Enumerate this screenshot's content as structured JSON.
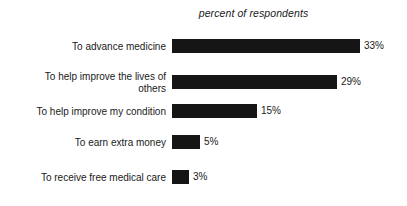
{
  "chart_data": {
    "type": "bar",
    "orientation": "horizontal",
    "title": "percent of respondents",
    "xlabel": "",
    "ylabel": "",
    "xlim": [
      0,
      33
    ],
    "grid": false,
    "legend": "none",
    "value_suffix": "%",
    "categories": [
      "To advance medicine",
      "To help improve the lives of\nothers",
      "To help improve my condition",
      "To earn extra money",
      "To receive free medical care"
    ],
    "values": [
      33,
      29,
      15,
      5,
      3
    ],
    "value_labels": [
      "33%",
      "29%",
      "15%",
      "5%",
      "3%"
    ],
    "bar_color": "#151515",
    "background_color": "#ffffff",
    "text_color": "#1a1a1a"
  }
}
